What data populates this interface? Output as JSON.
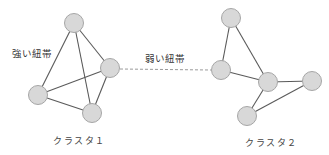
{
  "diagram": {
    "labels": {
      "strong_tie": "強い紐帯",
      "weak_tie": "弱い紐帯",
      "cluster1": "クラスタ１",
      "cluster2": "クラスタ２"
    },
    "colors": {
      "node_fill": "#d8d8d8",
      "node_stroke": "#a6a6a6",
      "edge": "#5a5a5a",
      "weak_edge": "#9a9a9a"
    },
    "clusters": [
      {
        "name": "クラスタ１",
        "nodes": [
          {
            "id": "c1-top",
            "x": 74,
            "y": 23
          },
          {
            "id": "c1-right",
            "x": 110,
            "y": 68
          },
          {
            "id": "c1-left",
            "x": 38,
            "y": 95
          },
          {
            "id": "c1-bottom",
            "x": 92,
            "y": 113
          }
        ],
        "edges": [
          [
            "c1-top",
            "c1-left"
          ],
          [
            "c1-top",
            "c1-right"
          ],
          [
            "c1-top",
            "c1-bottom"
          ],
          [
            "c1-left",
            "c1-right"
          ],
          [
            "c1-left",
            "c1-bottom"
          ],
          [
            "c1-right",
            "c1-bottom"
          ]
        ]
      },
      {
        "name": "クラスタ２",
        "nodes": [
          {
            "id": "c2-top",
            "x": 231,
            "y": 18
          },
          {
            "id": "c2-midleft",
            "x": 221,
            "y": 70
          },
          {
            "id": "c2-center",
            "x": 268,
            "y": 82
          },
          {
            "id": "c2-right",
            "x": 312,
            "y": 81
          },
          {
            "id": "c2-bottom",
            "x": 247,
            "y": 116
          }
        ],
        "edges": [
          [
            "c2-top",
            "c2-midleft"
          ],
          [
            "c2-top",
            "c2-center"
          ],
          [
            "c2-midleft",
            "c2-center"
          ],
          [
            "c2-center",
            "c2-right"
          ],
          [
            "c2-center",
            "c2-bottom"
          ],
          [
            "c2-bottom",
            "c2-right"
          ]
        ]
      }
    ],
    "weak_edge": [
      "c1-right",
      "c2-midleft"
    ]
  }
}
